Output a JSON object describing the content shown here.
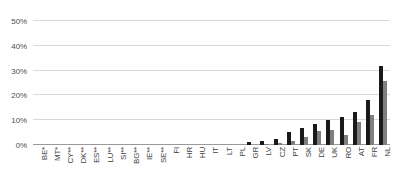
{
  "chart_data": {
    "type": "bar",
    "title": "",
    "subtitle": "",
    "xlabel": "",
    "ylabel": "",
    "ylim": [
      0,
      50
    ],
    "yticks": [
      0,
      10,
      20,
      30,
      40,
      50
    ],
    "ytick_labels": [
      "0%",
      "10%",
      "20%",
      "30%",
      "40%",
      "50%"
    ],
    "grid": true,
    "legend": "none",
    "orientation": "vertical",
    "bar_style": "grouped",
    "categories": [
      "BE*",
      "MT*",
      "CY**",
      "DK**",
      "ES**",
      "LU**",
      "SI**",
      "BG**",
      "IE**",
      "SE**",
      "FI",
      "HR",
      "HU",
      "IT",
      "LT",
      "PL",
      "GR",
      "LV",
      "CZ",
      "PT",
      "SK",
      "DE",
      "UK",
      "RO",
      "AT",
      "FR",
      "NL"
    ],
    "series": [
      {
        "name": "series-1",
        "color": "#1a1a1a",
        "values": [
          0,
          0,
          0,
          0,
          0,
          0,
          0,
          0,
          0,
          0,
          0,
          0,
          0,
          0,
          0,
          0,
          1.2,
          1.6,
          2.6,
          5.4,
          6.8,
          8.4,
          10.0,
          11.2,
          13.2,
          18.0,
          32.0
        ]
      },
      {
        "name": "series-2",
        "color": "#7f7f7f",
        "values": [
          0,
          0,
          0,
          0,
          0,
          0,
          0,
          0,
          0,
          0,
          0,
          0,
          0,
          0,
          0,
          0,
          0,
          0.6,
          0.8,
          1.8,
          3.2,
          5.8,
          6.0,
          4.0,
          9.2,
          12.0,
          26.0
        ]
      }
    ]
  }
}
